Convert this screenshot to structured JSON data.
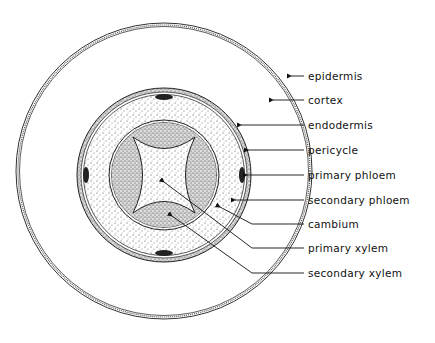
{
  "diagram": {
    "type": "cross-section",
    "labels": [
      {
        "text": "epidermis",
        "y": 76
      },
      {
        "text": "cortex",
        "y": 100
      },
      {
        "text": "endodermis",
        "y": 125
      },
      {
        "text": "pericycle",
        "y": 150
      },
      {
        "text": "primary phloem",
        "y": 175
      },
      {
        "text": "secondary phloem",
        "y": 200
      },
      {
        "text": "cambium",
        "y": 224
      },
      {
        "text": "primary xylem",
        "y": 248
      },
      {
        "text": "secondary xylem",
        "y": 273
      }
    ]
  }
}
